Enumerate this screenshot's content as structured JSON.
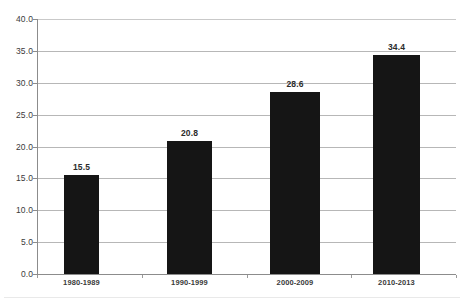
{
  "chart_data": {
    "type": "bar",
    "title": "",
    "subtitle": "",
    "xlabel": "",
    "ylabel": "",
    "categories": [
      "1980-1989",
      "1990-1999",
      "2000-2009",
      "2010-2013"
    ],
    "values": [
      15.5,
      20.8,
      28.6,
      34.4
    ],
    "value_labels": [
      "15.5",
      "20.8",
      "28.6",
      "34.4"
    ],
    "ylim": [
      0.0,
      40.0
    ],
    "ytick_step": 5.0,
    "ytick_labels": [
      "40.0",
      "35.0",
      "30.0",
      "25.0",
      "20.0",
      "15.0",
      "10.0",
      "5.0",
      "0.0"
    ],
    "ytick_values": [
      40.0,
      35.0,
      30.0,
      25.0,
      20.0,
      15.0,
      10.0,
      5.0,
      0.0
    ],
    "grid": true,
    "grid_axis": "y",
    "legend": false,
    "legend_position": "none",
    "series": [
      {
        "name": "",
        "values": [
          15.5,
          20.8,
          28.6,
          34.4
        ],
        "color": "#151515"
      }
    ],
    "colors": {
      "bar": "#151515",
      "gridline": "#b7b7b7",
      "axis": "#8c8c8c",
      "tick_text": "#3b3b3b",
      "value_text": "#2b2b2b",
      "background": "#ffffff"
    }
  }
}
